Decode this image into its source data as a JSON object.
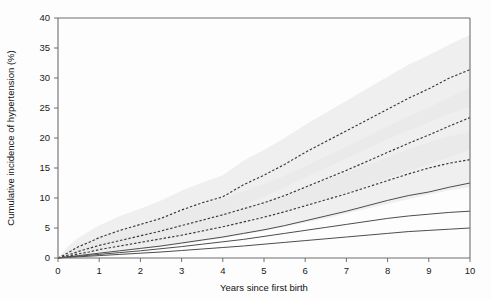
{
  "chart_data": {
    "type": "line",
    "title": "",
    "xlabel": "Years since first birth",
    "ylabel": "Cumulative incidence of hypertension (%)",
    "xlim": [
      0,
      10
    ],
    "ylim": [
      0,
      40
    ],
    "xticks": [
      0,
      1,
      2,
      3,
      4,
      5,
      6,
      7,
      8,
      9,
      10
    ],
    "yticks": [
      0,
      5,
      10,
      15,
      20,
      25,
      30,
      35,
      40
    ],
    "grid": false,
    "legend": "none",
    "x": [
      0,
      0.25,
      0.5,
      0.75,
      1,
      1.5,
      2,
      2.5,
      3,
      3.5,
      4,
      4.5,
      5,
      5.5,
      6,
      6.5,
      7,
      7.5,
      8,
      8.5,
      9,
      9.5,
      10
    ],
    "series": [
      {
        "name": "curve-1-dashed-highest",
        "style": "dashed",
        "values": [
          0,
          0.9,
          1.9,
          2.6,
          3.4,
          4.6,
          5.6,
          6.6,
          8.0,
          9.2,
          10.2,
          12.2,
          13.8,
          15.6,
          17.6,
          19.4,
          21.2,
          23.0,
          24.8,
          26.6,
          28.2,
          30.0,
          31.4
        ],
        "ci_upper": [
          0,
          2.0,
          3.4,
          4.4,
          5.4,
          7.0,
          8.2,
          9.6,
          11.2,
          12.6,
          13.8,
          16.2,
          18.0,
          20.0,
          22.2,
          24.2,
          26.2,
          28.2,
          30.2,
          32.2,
          33.8,
          35.6,
          37.2
        ],
        "ci_lower": [
          0,
          0.3,
          0.9,
          1.4,
          1.9,
          2.8,
          3.5,
          4.3,
          5.4,
          6.4,
          7.2,
          8.8,
          10.2,
          11.8,
          13.4,
          15.0,
          16.6,
          18.2,
          19.8,
          21.2,
          22.6,
          24.0,
          25.2
        ]
      },
      {
        "name": "curve-2-dashed-middle",
        "style": "dashed",
        "values": [
          0,
          0.5,
          1.1,
          1.6,
          2.1,
          2.9,
          3.7,
          4.5,
          5.4,
          6.3,
          7.2,
          8.2,
          9.2,
          10.4,
          11.8,
          13.2,
          14.6,
          16.1,
          17.6,
          19.1,
          20.5,
          22.0,
          23.4
        ],
        "ci_upper": [
          0,
          1.2,
          2.1,
          2.8,
          3.5,
          4.6,
          5.6,
          6.6,
          7.7,
          8.8,
          9.9,
          11.1,
          12.3,
          13.7,
          15.3,
          16.9,
          18.5,
          20.2,
          21.9,
          23.6,
          25.1,
          26.8,
          28.4
        ],
        "ci_lower": [
          0,
          0.2,
          0.5,
          0.8,
          1.2,
          1.7,
          2.3,
          2.9,
          3.6,
          4.3,
          5.0,
          5.8,
          6.6,
          7.6,
          8.7,
          9.8,
          10.9,
          12.1,
          13.3,
          14.5,
          15.6,
          16.8,
          18.0
        ]
      },
      {
        "name": "curve-3-dashed-lowest",
        "style": "dashed",
        "values": [
          0,
          0.3,
          0.7,
          1.0,
          1.4,
          2.0,
          2.6,
          3.2,
          3.8,
          4.5,
          5.2,
          6.0,
          6.8,
          7.7,
          8.7,
          9.7,
          10.7,
          11.8,
          12.9,
          14.0,
          15.0,
          15.8,
          16.4
        ],
        "ci_upper": [
          0,
          0.8,
          1.4,
          1.9,
          2.4,
          3.3,
          4.1,
          4.9,
          5.7,
          6.6,
          7.5,
          8.5,
          9.5,
          10.6,
          11.8,
          13.0,
          14.2,
          15.5,
          16.8,
          18.1,
          19.3,
          20.3,
          21.0
        ],
        "ci_lower": [
          0,
          0.1,
          0.3,
          0.5,
          0.7,
          1.1,
          1.5,
          1.9,
          2.3,
          2.8,
          3.3,
          3.9,
          4.5,
          5.2,
          5.9,
          6.6,
          7.4,
          8.2,
          9.0,
          9.8,
          10.6,
          11.3,
          11.8
        ]
      },
      {
        "name": "curve-4-solid-highest",
        "style": "solid",
        "values": [
          0,
          0.2,
          0.4,
          0.6,
          0.8,
          1.2,
          1.6,
          2.0,
          2.5,
          3.0,
          3.5,
          4.1,
          4.7,
          5.4,
          6.2,
          7.0,
          7.8,
          8.7,
          9.6,
          10.4,
          11.0,
          11.8,
          12.5
        ]
      },
      {
        "name": "curve-5-solid-middle",
        "style": "solid",
        "values": [
          0,
          0.15,
          0.3,
          0.45,
          0.6,
          0.9,
          1.2,
          1.55,
          1.9,
          2.3,
          2.7,
          3.1,
          3.6,
          4.1,
          4.6,
          5.1,
          5.6,
          6.1,
          6.6,
          7.0,
          7.3,
          7.6,
          7.8
        ]
      },
      {
        "name": "curve-6-solid-lowest",
        "style": "solid",
        "values": [
          0,
          0.1,
          0.2,
          0.3,
          0.4,
          0.6,
          0.8,
          1.0,
          1.25,
          1.5,
          1.75,
          2.0,
          2.3,
          2.6,
          2.9,
          3.2,
          3.5,
          3.8,
          4.1,
          4.4,
          4.6,
          4.8,
          5.0
        ]
      }
    ]
  },
  "axes": {
    "x_tick_labels": [
      "0",
      "1",
      "2",
      "3",
      "4",
      "5",
      "6",
      "7",
      "8",
      "9",
      "10"
    ],
    "y_tick_labels": [
      "0",
      "5",
      "10",
      "15",
      "20",
      "25",
      "30",
      "35",
      "40"
    ],
    "x_title": "Years since first birth",
    "y_title": "Cumulative incidence of hypertension (%)"
  }
}
